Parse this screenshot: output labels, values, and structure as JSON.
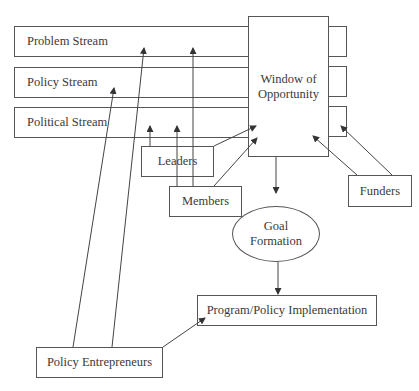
{
  "diagram": {
    "streams": [
      {
        "label": "Problem Stream"
      },
      {
        "label": "Policy Stream"
      },
      {
        "label": "Political Stream"
      }
    ],
    "window": {
      "line1": "Window of",
      "line2": "Opportunity"
    },
    "actors": {
      "leaders": "Leaders",
      "members": "Members",
      "funders": "Funders",
      "policy_entrepreneurs": "Policy Entrepreneurs"
    },
    "goal": {
      "line1": "Goal",
      "line2": "Formation"
    },
    "implementation": "Program/Policy Implementation",
    "line_color": "#444444"
  }
}
